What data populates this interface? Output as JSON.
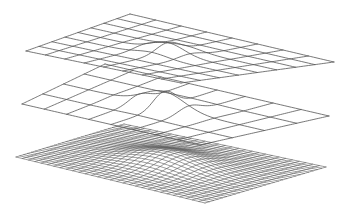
{
  "figure": {
    "background": "#ffffff",
    "line_color": "#555555",
    "layers": [
      {
        "name": "coarse-level",
        "corners": {
          "left": [
            26,
            51
          ],
          "back": [
            130,
            14
          ],
          "right": [
            334,
            62
          ],
          "front": [
            181,
            83
          ]
        },
        "grid_u": 8,
        "grid_v": 8,
        "peak": {
          "u": 0.5,
          "v": 0.5,
          "height": 10,
          "width": 0.09
        },
        "stroke_width": 0.8
      },
      {
        "name": "middle-level",
        "corners": {
          "left": [
            22,
            104
          ],
          "back": [
            105,
            64
          ],
          "right": [
            329,
            116
          ],
          "front": [
            200,
            145
          ]
        },
        "grid_u": 8,
        "grid_v": 4,
        "peak": {
          "u": 0.5,
          "v": 0.5,
          "height": 16,
          "width": 0.1
        },
        "stroke_width": 0.8
      },
      {
        "name": "fine-level",
        "corners": {
          "left": [
            16,
            157
          ],
          "back": [
            124,
            124
          ],
          "right": [
            326,
            167
          ],
          "front": [
            205,
            203
          ]
        },
        "grid_u": 30,
        "grid_v": 28,
        "peak": {
          "u": 0.5,
          "v": 0.5,
          "height": 11,
          "width": 0.16
        },
        "stroke_width": 0.6
      }
    ]
  }
}
